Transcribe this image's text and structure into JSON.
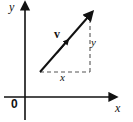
{
  "figure": {
    "background_color": "#ffffff",
    "stroke_color": "#111111",
    "dash_color": "#555555"
  },
  "axes": {
    "y_label": "y",
    "x_label": "x",
    "origin_label": "0"
  },
  "vector": {
    "label": "v",
    "tail": {
      "x": 40,
      "y": 72
    },
    "tip": {
      "x": 90,
      "y": 15
    },
    "direction_marker": "mid-arrowhead"
  },
  "components": {
    "x_label": "x",
    "y_label": "y"
  },
  "icons": {
    "y_axis_arrow": "arrow-up-icon",
    "x_axis_arrow": "arrow-right-icon",
    "vector_arrow": "arrow-up-right-icon"
  }
}
